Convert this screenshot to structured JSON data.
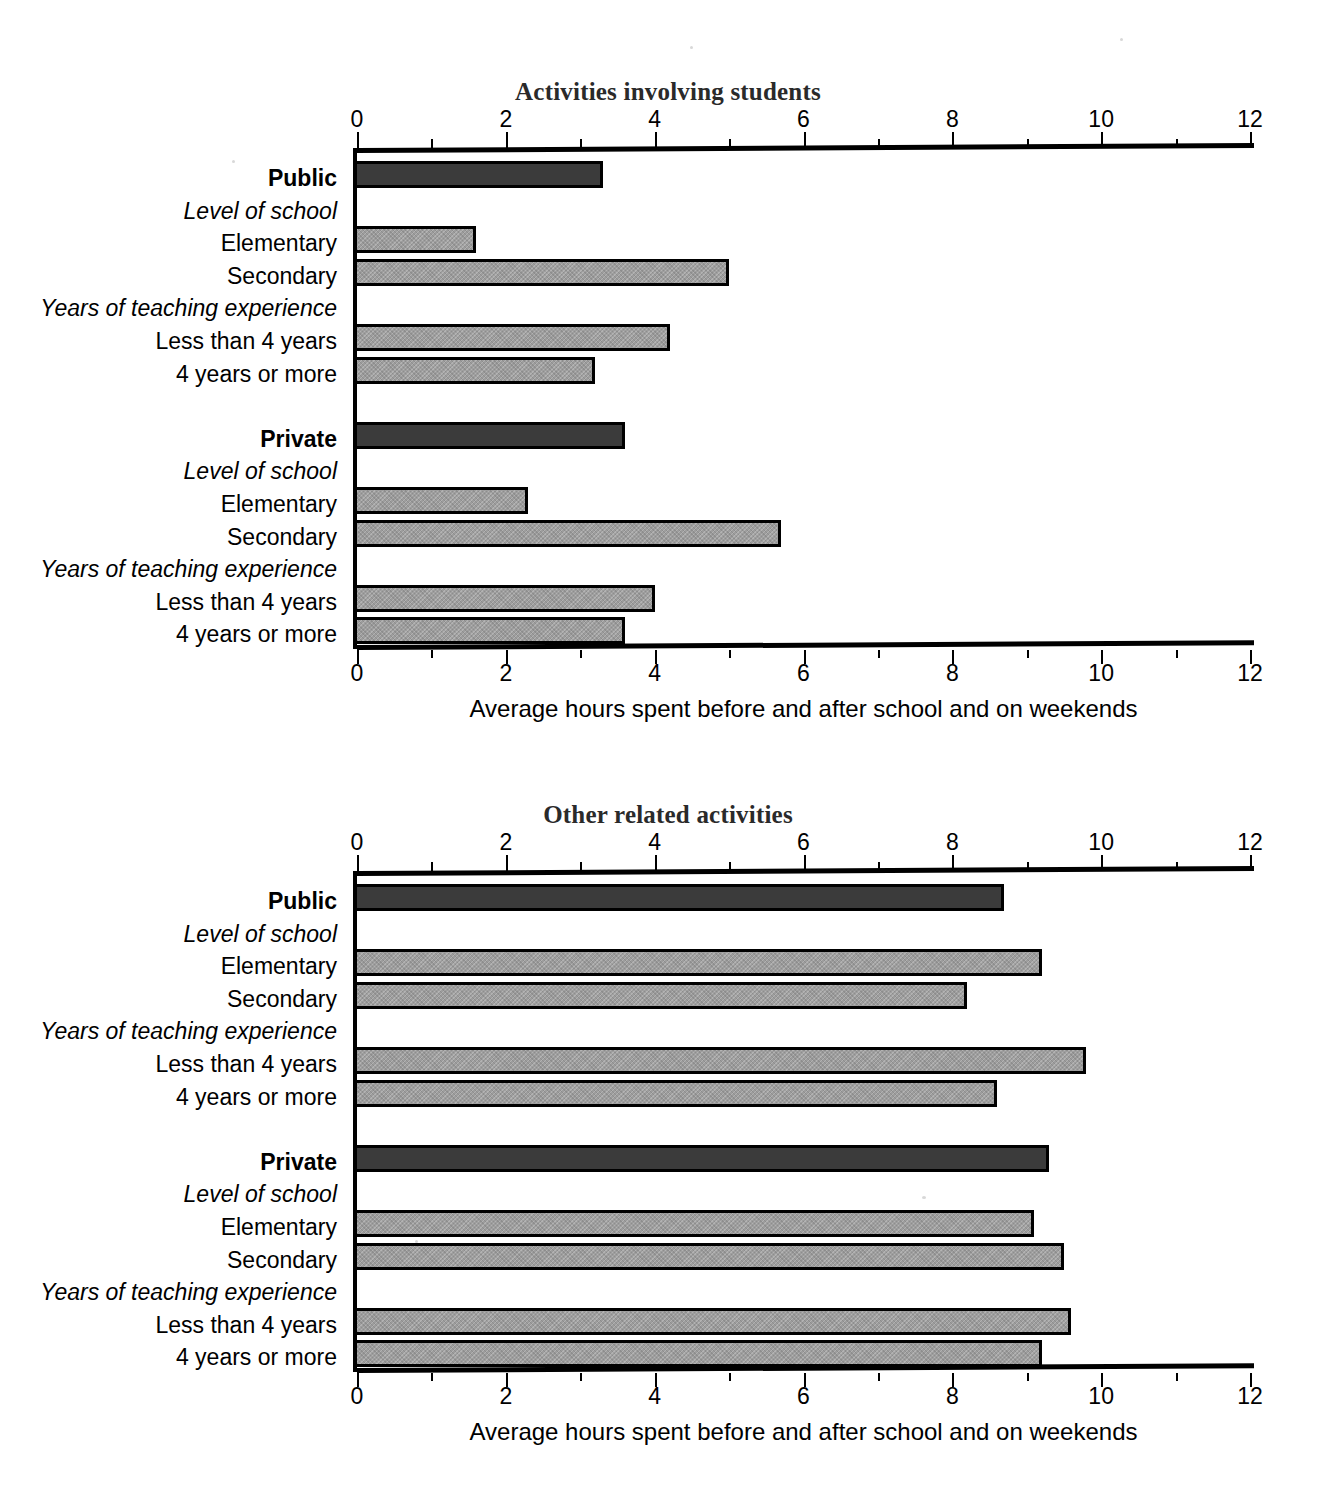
{
  "chart_data": [
    {
      "type": "bar",
      "orientation": "horizontal",
      "title": "Activities involving students",
      "xlabel": "Average hours spent before and after school and on weekends",
      "ylabel": "",
      "xlim": [
        0,
        12
      ],
      "xticks": [
        0,
        2,
        4,
        6,
        8,
        10,
        12
      ],
      "xticklabels": [
        "0",
        "2",
        "4",
        "6",
        "8",
        "10",
        "12"
      ],
      "minor_tick_step": 1,
      "grid": false,
      "legend": "none",
      "axis_top": true,
      "axis_bottom": true,
      "rows": [
        {
          "label": "Public",
          "style": "bold",
          "value": 3.3,
          "bar": "dark"
        },
        {
          "label": "Level of school",
          "style": "italic",
          "value": null,
          "bar": "none"
        },
        {
          "label": "Elementary",
          "style": "plain",
          "value": 1.6,
          "bar": "light"
        },
        {
          "label": "Secondary",
          "style": "plain",
          "value": 5.0,
          "bar": "light"
        },
        {
          "label": "Years of teaching experience",
          "style": "italic",
          "value": null,
          "bar": "none"
        },
        {
          "label": "Less than 4 years",
          "style": "plain",
          "value": 4.2,
          "bar": "light"
        },
        {
          "label": "4 years or more",
          "style": "plain",
          "value": 3.2,
          "bar": "light"
        },
        {
          "label": "",
          "style": "plain",
          "value": null,
          "bar": "none"
        },
        {
          "label": "Private",
          "style": "bold",
          "value": 3.6,
          "bar": "dark"
        },
        {
          "label": "Level of school",
          "style": "italic",
          "value": null,
          "bar": "none"
        },
        {
          "label": "Elementary",
          "style": "plain",
          "value": 2.3,
          "bar": "light"
        },
        {
          "label": "Secondary",
          "style": "plain",
          "value": 5.7,
          "bar": "light"
        },
        {
          "label": "Years of teaching experience",
          "style": "italic",
          "value": null,
          "bar": "none"
        },
        {
          "label": "Less than 4 years",
          "style": "plain",
          "value": 4.0,
          "bar": "light"
        },
        {
          "label": "4 years or more",
          "style": "plain",
          "value": 3.6,
          "bar": "light"
        }
      ]
    },
    {
      "type": "bar",
      "orientation": "horizontal",
      "title": "Other related activities",
      "xlabel": "Average hours spent before and after school and on weekends",
      "ylabel": "",
      "xlim": [
        0,
        12
      ],
      "xticks": [
        0,
        2,
        4,
        6,
        8,
        10,
        12
      ],
      "xticklabels": [
        "0",
        "2",
        "4",
        "6",
        "8",
        "10",
        "12"
      ],
      "minor_tick_step": 1,
      "grid": false,
      "legend": "none",
      "axis_top": true,
      "axis_bottom": true,
      "rows": [
        {
          "label": "Public",
          "style": "bold",
          "value": 8.7,
          "bar": "dark"
        },
        {
          "label": "Level of school",
          "style": "italic",
          "value": null,
          "bar": "none"
        },
        {
          "label": "Elementary",
          "style": "plain",
          "value": 9.2,
          "bar": "light"
        },
        {
          "label": "Secondary",
          "style": "plain",
          "value": 8.2,
          "bar": "light"
        },
        {
          "label": "Years of teaching experience",
          "style": "italic",
          "value": null,
          "bar": "none"
        },
        {
          "label": "Less than 4 years",
          "style": "plain",
          "value": 9.8,
          "bar": "light"
        },
        {
          "label": "4 years or more",
          "style": "plain",
          "value": 8.6,
          "bar": "light"
        },
        {
          "label": "",
          "style": "plain",
          "value": null,
          "bar": "none"
        },
        {
          "label": "Private",
          "style": "bold",
          "value": 9.3,
          "bar": "dark"
        },
        {
          "label": "Level of school",
          "style": "italic",
          "value": null,
          "bar": "none"
        },
        {
          "label": "Elementary",
          "style": "plain",
          "value": 9.1,
          "bar": "light"
        },
        {
          "label": "Secondary",
          "style": "plain",
          "value": 9.5,
          "bar": "light"
        },
        {
          "label": "Years of teaching experience",
          "style": "italic",
          "value": null,
          "bar": "none"
        },
        {
          "label": "Less than 4 years",
          "style": "plain",
          "value": 9.6,
          "bar": "light"
        },
        {
          "label": "4 years or more",
          "style": "plain",
          "value": 9.2,
          "bar": "light"
        }
      ]
    }
  ],
  "colors": {
    "bar_dark": "#3b3b3b",
    "bar_light": "#9d9d9d",
    "outline": "#000000",
    "title": "#2a2a2a",
    "axis": "#000000"
  }
}
